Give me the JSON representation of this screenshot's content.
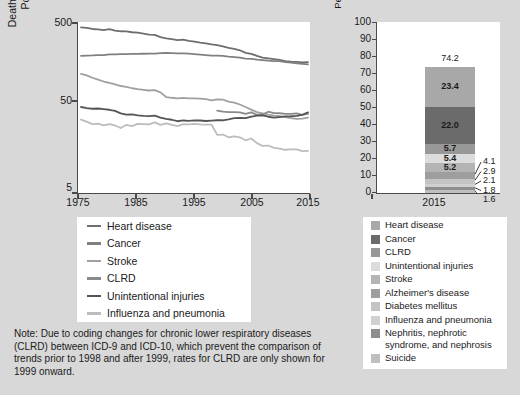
{
  "left": {
    "axis": {
      "ylabel": "Deaths per 100,000 Resident Population (log scale)",
      "yticks": [
        "500",
        "50",
        "5"
      ],
      "xticks": [
        "1975",
        "1985",
        "1995",
        "2005",
        "2015"
      ]
    },
    "legend": [
      {
        "label": "Heart disease",
        "color": "#6e6e6e"
      },
      {
        "label": "Cancer",
        "color": "#808080"
      },
      {
        "label": "Stroke",
        "color": "#a0a0a0"
      },
      {
        "label": "CLRD",
        "color": "#8a8a8a"
      },
      {
        "label": "Unintentional injuries",
        "color": "#555555"
      },
      {
        "label": "Influenza and pneumonia",
        "color": "#bcbcbc"
      }
    ],
    "note": "Note: Due to coding changes for chronic lower respiratory diseases (CLRD) between ICD-9 and ICD-10, which prevent the comparison of trends prior to 1998 and after 1999, rates for CLRD are only shown for 1999 onward."
  },
  "right": {
    "axis": {
      "ylabel": "Percent of Total Number of Deaths",
      "yticks": [
        "100",
        "90",
        "80",
        "70",
        "60",
        "50",
        "40",
        "30",
        "20",
        "10",
        "0"
      ],
      "ylim": [
        0,
        100
      ],
      "xticks": [
        "2015"
      ]
    },
    "bar_total": "74.2",
    "legend": [
      {
        "label": "Heart disease",
        "color": "#a8a8a8"
      },
      {
        "label": "Cancer",
        "color": "#6b6b6b"
      },
      {
        "label": "CLRD",
        "color": "#989898"
      },
      {
        "label": "Unintentional injuries",
        "color": "#dcdcdc"
      },
      {
        "label": "Stroke",
        "color": "#b4b4b4"
      },
      {
        "label": "Alzheimer's disease",
        "color": "#9e9e9e"
      },
      {
        "label": "Diabetes mellitus",
        "color": "#c4c4c4"
      },
      {
        "label": "Influenza and pneumonia",
        "color": "#d0d0d0"
      },
      {
        "label": "Nephritis, nephrotic",
        "label2": "syndrome, and nephrosis",
        "color": "#8e8e8e"
      },
      {
        "label": "Suicide",
        "color": "#bfbfbf"
      }
    ]
  },
  "chart_data": [
    {
      "type": "line",
      "title": "",
      "xlabel": "",
      "ylabel": "Deaths per 100,000 Resident Population (log scale)",
      "xlim": [
        1975,
        2015
      ],
      "ylim": [
        5,
        500
      ],
      "yscale": "log",
      "grid": false,
      "legend_position": "below",
      "x": [
        1975,
        1976,
        1977,
        1978,
        1979,
        1980,
        1981,
        1982,
        1983,
        1984,
        1985,
        1986,
        1987,
        1988,
        1989,
        1990,
        1991,
        1992,
        1993,
        1994,
        1995,
        1996,
        1997,
        1998,
        1999,
        2000,
        2001,
        2002,
        2003,
        2004,
        2005,
        2006,
        2007,
        2008,
        2009,
        2010,
        2011,
        2012,
        2013,
        2014,
        2015
      ],
      "series": [
        {
          "name": "Heart disease",
          "color": "#6e6e6e",
          "values": [
            431.2,
            426.3,
            413.7,
            409.9,
            401.6,
            412.1,
            397.0,
            389.0,
            388.9,
            378.8,
            375.0,
            365.1,
            355.9,
            352.5,
            332.0,
            321.8,
            313.8,
            306.1,
            309.9,
            299.7,
            293.4,
            285.7,
            280.4,
            272.4,
            267.8,
            257.6,
            247.8,
            240.8,
            232.3,
            217.0,
            211.1,
            200.2,
            190.9,
            186.5,
            182.8,
            179.1,
            173.7,
            170.5,
            169.8,
            167.0,
            168.5
          ]
        },
        {
          "name": "Cancer",
          "color": "#808080",
          "values": [
            200.1,
            201.5,
            202.2,
            203.9,
            204.0,
            207.9,
            208.3,
            208.9,
            209.3,
            210.8,
            211.3,
            211.5,
            212.0,
            212.5,
            214.8,
            216.0,
            215.6,
            214.3,
            213.2,
            212.1,
            209.9,
            206.7,
            203.4,
            200.8,
            200.8,
            199.6,
            196.0,
            193.5,
            190.1,
            185.8,
            183.8,
            180.7,
            178.4,
            175.3,
            173.5,
            172.8,
            168.6,
            166.5,
            163.2,
            161.2,
            158.5
          ]
        },
        {
          "name": "Stroke",
          "color": "#a0a0a0",
          "values": [
            122.6,
            117.8,
            110.4,
            105.2,
            99.7,
            96.2,
            92.1,
            88.3,
            86.3,
            83.1,
            81.0,
            79.6,
            78.2,
            79.0,
            74.4,
            65.5,
            64.2,
            63.2,
            64.0,
            63.1,
            63.1,
            62.8,
            61.8,
            59.9,
            61.4,
            60.9,
            58.0,
            56.2,
            53.5,
            50.0,
            46.6,
            43.6,
            42.2,
            40.7,
            39.6,
            39.1,
            37.9,
            36.9,
            36.2,
            36.5,
            37.6
          ]
        },
        {
          "name": "CLRD",
          "color": "#8a8a8a",
          "values": [
            null,
            null,
            null,
            null,
            null,
            null,
            null,
            null,
            null,
            null,
            null,
            null,
            null,
            null,
            null,
            null,
            null,
            null,
            null,
            null,
            null,
            null,
            null,
            null,
            45.4,
            44.2,
            43.6,
            43.5,
            43.3,
            41.5,
            43.2,
            40.5,
            40.8,
            44.0,
            42.3,
            42.2,
            41.6,
            41.5,
            42.1,
            40.5,
            41.6
          ]
        },
        {
          "name": "Unintentional injuries",
          "color": "#555555",
          "values": [
            50.0,
            48.5,
            47.7,
            48.0,
            47.2,
            46.4,
            45.0,
            42.1,
            40.6,
            40.9,
            39.8,
            39.3,
            39.0,
            39.5,
            37.5,
            36.3,
            35.4,
            34.0,
            34.7,
            34.4,
            34.8,
            34.7,
            34.2,
            34.5,
            34.9,
            34.9,
            35.7,
            36.9,
            37.2,
            37.0,
            38.6,
            39.5,
            39.9,
            38.4,
            37.4,
            38.0,
            38.7,
            38.9,
            39.4,
            40.5,
            43.2
          ]
        },
        {
          "name": "Influenza and pneumonia",
          "color": "#bcbcbc",
          "values": [
            35.6,
            33.6,
            31.4,
            31.9,
            30.4,
            31.4,
            30.3,
            28.3,
            30.9,
            29.8,
            31.6,
            31.5,
            31.2,
            33.0,
            30.8,
            32.0,
            30.9,
            29.8,
            31.4,
            31.3,
            31.6,
            31.2,
            31.0,
            31.1,
            23.5,
            23.7,
            22.0,
            22.6,
            22.0,
            20.3,
            21.3,
            18.8,
            17.4,
            17.6,
            16.5,
            16.2,
            15.7,
            15.9,
            15.9,
            15.1,
            15.2
          ]
        }
      ]
    },
    {
      "type": "bar",
      "subtype": "stacked",
      "title": "",
      "xlabel": "",
      "ylabel": "Percent of Total Number of Deaths",
      "categories": [
        "2015"
      ],
      "ylim": [
        0,
        100
      ],
      "total": 74.2,
      "grid": false,
      "legend_position": "below",
      "segments": [
        {
          "name": "Heart disease",
          "value": 23.4,
          "color": "#a8a8a8",
          "labeled_inside": true
        },
        {
          "name": "Cancer",
          "value": 22.0,
          "color": "#6b6b6b",
          "labeled_inside": true
        },
        {
          "name": "CLRD",
          "value": 5.7,
          "color": "#989898",
          "labeled_inside": true
        },
        {
          "name": "Unintentional injuries",
          "value": 5.4,
          "color": "#dcdcdc",
          "labeled_inside": true
        },
        {
          "name": "Stroke",
          "value": 5.2,
          "color": "#b4b4b4",
          "labeled_inside": true
        },
        {
          "name": "Alzheimer's disease",
          "value": 4.1,
          "color": "#9e9e9e",
          "labeled_inside": false
        },
        {
          "name": "Diabetes mellitus",
          "value": 2.9,
          "color": "#c4c4c4",
          "labeled_inside": false
        },
        {
          "name": "Influenza and pneumonia",
          "value": 2.1,
          "color": "#d0d0d0",
          "labeled_inside": false
        },
        {
          "name": "Nephritis, nephrotic syndrome, and nephrosis",
          "value": 1.8,
          "color": "#8e8e8e",
          "labeled_inside": false
        },
        {
          "name": "Suicide",
          "value": 1.6,
          "color": "#bfbfbf",
          "labeled_inside": false
        }
      ],
      "callout_labels": [
        "4.1",
        "2.9",
        "2.1",
        "1.8",
        "1.6"
      ]
    }
  ]
}
